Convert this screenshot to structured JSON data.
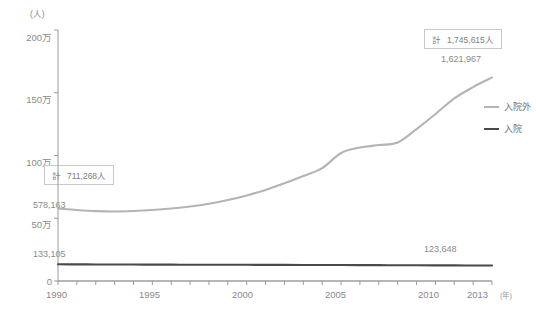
{
  "chart_data": {
    "type": "line",
    "title": "",
    "xlabel": "年",
    "ylabel": "人",
    "unit_note": "(人)",
    "xlim": [
      1990,
      2013
    ],
    "ylim": [
      0,
      2000000
    ],
    "grid": false,
    "legend_position": "right",
    "x": [
      1990,
      1991,
      1992,
      1993,
      1994,
      1995,
      1996,
      1997,
      1998,
      1999,
      2000,
      2001,
      2002,
      2003,
      2004,
      2005,
      2006,
      2007,
      2008,
      2009,
      2010,
      2011,
      2012,
      2013
    ],
    "series": [
      {
        "name": "入院外",
        "color": "#b4b4b4",
        "values": [
          578163,
          566000,
          557000,
          554000,
          558000,
          566000,
          578000,
          594000,
          616000,
          645000,
          682000,
          726000,
          778000,
          836000,
          899000,
          1020000,
          1063000,
          1083000,
          1104000,
          1210000,
          1330000,
          1455000,
          1545000,
          1621967
        ]
      },
      {
        "name": "入院",
        "color": "#4a4a4a",
        "values": [
          133105,
          132500,
          132000,
          131500,
          131000,
          130600,
          130200,
          130000,
          129800,
          129400,
          129000,
          128600,
          128200,
          127800,
          127400,
          127000,
          126600,
          126200,
          125800,
          125200,
          124700,
          124200,
          123900,
          123648
        ]
      }
    ],
    "y_ticks": [
      {
        "value": 0,
        "label": "0"
      },
      {
        "value": 500000,
        "label": "50万"
      },
      {
        "value": 1000000,
        "label": "100万"
      },
      {
        "value": 1500000,
        "label": "150万"
      },
      {
        "value": 2000000,
        "label": "200万"
      }
    ],
    "x_ticks_major": [
      {
        "value": 1990,
        "label": "1990"
      },
      {
        "value": 1995,
        "label": "1995"
      },
      {
        "value": 2000,
        "label": "2000"
      },
      {
        "value": 2005,
        "label": "2005"
      },
      {
        "value": 2010,
        "label": "2010"
      },
      {
        "value": 2013,
        "label": "2013"
      }
    ],
    "point_labels": [
      {
        "text": "578,163",
        "series": "入院外",
        "x": 1990
      },
      {
        "text": "133,105",
        "series": "入院",
        "x": 1990
      },
      {
        "text": "1,621,967",
        "series": "入院外",
        "x": 2013
      },
      {
        "text": "123,648",
        "series": "入院",
        "x": 2013
      }
    ],
    "annotations": [
      {
        "prefix": "計",
        "text": "711,268人",
        "x": 1990
      },
      {
        "prefix": "計",
        "text": "1,745,615人",
        "x": 2013
      }
    ]
  },
  "axes": {
    "unit_top": "(人)",
    "x_unit_suffix": "(年)"
  },
  "labels": {
    "y0": "0",
    "y50": "50万",
    "y100": "100万",
    "y150": "150万",
    "y200": "200万",
    "x1990": "1990",
    "x1995": "1995",
    "x2000": "2000",
    "x2005": "2005",
    "x2010": "2010",
    "x2013": "2013",
    "val_start_gray": "578,163",
    "val_start_dark": "133,105",
    "val_end_gray": "1,621,967",
    "val_end_dark": "123,648"
  },
  "callouts": {
    "left": {
      "prefix": "計",
      "value": "711,268人"
    },
    "right": {
      "prefix": "計",
      "value": "1,745,615人"
    }
  },
  "legend": {
    "items": [
      {
        "label": "入院外",
        "color": "#b4b4b4"
      },
      {
        "label": "入院",
        "color": "#4a4a4a"
      }
    ]
  },
  "colors": {
    "outpatient_line": "#b4b4b4",
    "inpatient_line": "#4a4a4a",
    "axis": "#9a9a9a",
    "text": "#8a8a8a",
    "callout_border": "#c9c9c9",
    "background": "#ffffff"
  }
}
